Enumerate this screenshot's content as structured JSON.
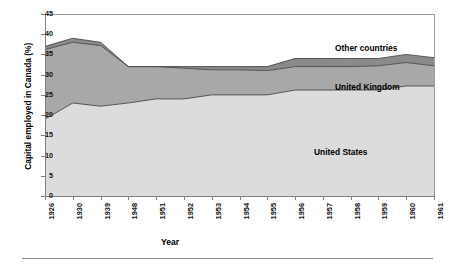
{
  "chart_data": {
    "type": "area",
    "stacked": true,
    "title": "",
    "subtitle": "",
    "xlabel": "Year",
    "ylabel": "Capital employed in Canada (%)",
    "ylim": [
      0,
      45
    ],
    "ytick_step": 5,
    "grid": false,
    "legend_position": "inline-on-plot",
    "categories": [
      "1926",
      "1930",
      "1939",
      "1948",
      "1951",
      "1952",
      "1953",
      "1954",
      "1955",
      "1956",
      "1957",
      "1958",
      "1959",
      "1960",
      "1961"
    ],
    "ytick_labels": [
      "0",
      "5",
      "10",
      "15",
      "20",
      "25",
      "30",
      "35",
      "40",
      "45"
    ],
    "series": [
      {
        "name": "United States",
        "color": "#dcdcdc",
        "values": [
          19.0,
          23.0,
          22.2,
          23.0,
          24.0,
          24.0,
          25.0,
          25.0,
          25.0,
          26.2,
          26.2,
          26.2,
          26.2,
          27.2,
          27.2
        ]
      },
      {
        "name": "United Kingdom",
        "color": "#a8a8a8",
        "values": [
          17.2,
          15.0,
          15.0,
          9.0,
          8.0,
          7.6,
          6.2,
          6.2,
          6.0,
          5.8,
          5.8,
          5.8,
          6.0,
          5.8,
          5.0
        ]
      },
      {
        "name": "Other countries",
        "color": "#8a8a8a",
        "values": [
          0.8,
          1.0,
          0.8,
          0.0,
          0.0,
          0.4,
          0.8,
          0.8,
          1.0,
          2.0,
          2.0,
          2.0,
          1.8,
          2.0,
          2.0
        ]
      }
    ],
    "totals": [
      37.0,
      39.0,
      38.0,
      32.0,
      32.0,
      32.0,
      32.0,
      32.0,
      32.0,
      34.0,
      34.0,
      34.0,
      34.0,
      35.0,
      34.2
    ]
  },
  "labels": {
    "other_countries": "Other countries",
    "united_kingdom": "United Kingdom",
    "united_states": "United States"
  }
}
